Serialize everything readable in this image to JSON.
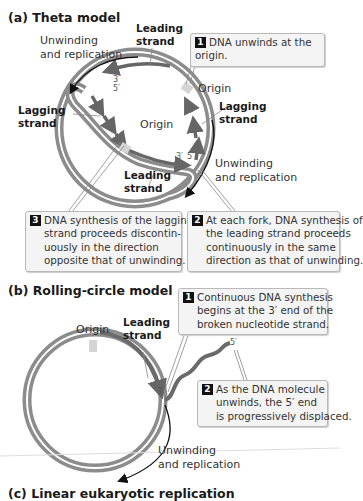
{
  "panel_a": {
    "title": "(a)  Theta model",
    "labels": {
      "unwinding_left_1": "Unwinding",
      "unwinding_left_2": "and replication",
      "unwinding_right_1": "Unwinding",
      "unwinding_right_2": "and replication",
      "leading_top_1": "Leading",
      "leading_top_2": "strand",
      "lagging_left_1": "Lagging",
      "lagging_left_2": "strand",
      "lagging_right_1": "Lagging",
      "lagging_right_2": "strand",
      "leading_bottom_1": "Leading",
      "leading_bottom_2": "strand",
      "origin_outer": "Origin",
      "origin_inner": "Origin",
      "prime3_top": "3′",
      "prime5_top": "5′",
      "prime3_bottom": "3′",
      "prime5_bottom": "5′"
    },
    "callouts": [
      {
        "number": "1",
        "lines": [
          "DNA unwinds at the origin."
        ]
      },
      {
        "number": "2",
        "lines": [
          "At each fork, DNA synthesis of",
          "the leading strand proceeds",
          "continuously in the same",
          "direction as that of unwinding."
        ]
      },
      {
        "number": "3",
        "lines": [
          "DNA synthesis of the lagging",
          "strand proceeds discontin-",
          "uously in the direction",
          "opposite that of unwinding."
        ]
      }
    ]
  },
  "panel_b": {
    "title": "(b)  Rolling-circle model",
    "labels": {
      "origin": "Origin",
      "leading_1": "Leading",
      "leading_2": "strand",
      "prime3": "3′",
      "prime5": "5′",
      "unwinding_1": "Unwinding",
      "unwinding_2": "and replication"
    },
    "callouts": [
      {
        "number": "1",
        "lines": [
          "Continuous DNA synthesis",
          "begins at the 3′ end of the",
          "broken nucleotide strand."
        ]
      },
      {
        "number": "2",
        "lines": [
          "As the DNA molecule",
          "unwinds, the 5′ end",
          "is progressively displaced."
        ]
      }
    ]
  },
  "panel_c": {
    "title": "(c)  Linear eukaryotic replication"
  },
  "colors": {
    "template_strand": "#8c8c8c",
    "new_strand": "#6a6a6a",
    "origin_marker": "#d4d4d4",
    "callout_fill": "#f4f4f4",
    "callout_border": "#b9b9b9",
    "badge": "#111111"
  }
}
